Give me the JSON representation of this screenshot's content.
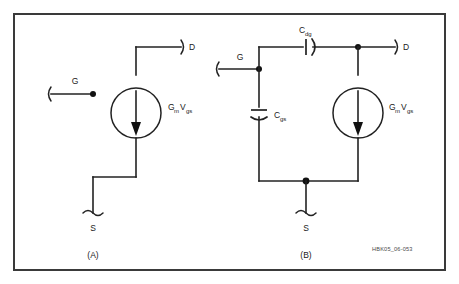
{
  "figure": {
    "code_label": "HBK05_06-053",
    "border_color": "#3a3a3a",
    "wire_color": "#222222",
    "background": "#ffffff"
  },
  "panels": [
    {
      "id": "A",
      "caption": "(A)",
      "title": "Simple transconductance model",
      "terminals": [
        {
          "name": "gate",
          "label": "G"
        },
        {
          "name": "drain",
          "label": "D"
        },
        {
          "name": "source",
          "label": "S"
        }
      ],
      "components": [
        {
          "type": "current-source",
          "name": "transconductance-source",
          "label_main": "G",
          "label_main_sub": "m",
          "label_second": "V",
          "label_second_sub": "gs"
        }
      ]
    },
    {
      "id": "B",
      "caption": "(B)",
      "title": "Transconductance model with parasitic capacitances",
      "terminals": [
        {
          "name": "gate",
          "label": "G"
        },
        {
          "name": "drain",
          "label": "D"
        },
        {
          "name": "source",
          "label": "S"
        }
      ],
      "components": [
        {
          "type": "capacitor",
          "name": "capacitor-cdg",
          "label_main": "C",
          "label_main_sub": "dg",
          "orientation": "horizontal"
        },
        {
          "type": "capacitor",
          "name": "capacitor-cgs",
          "label_main": "C",
          "label_main_sub": "gs",
          "orientation": "vertical"
        },
        {
          "type": "current-source",
          "name": "transconductance-source",
          "label_main": "G",
          "label_main_sub": "m",
          "label_second": "V",
          "label_second_sub": "gs"
        }
      ]
    }
  ]
}
